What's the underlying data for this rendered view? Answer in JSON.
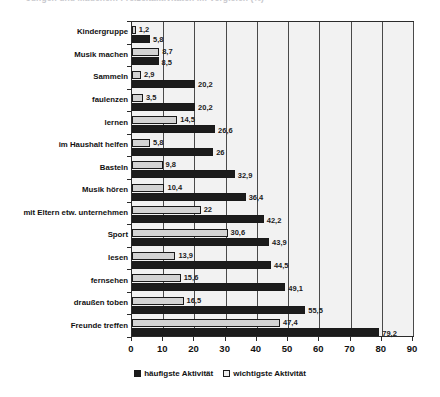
{
  "title_strip": {
    "text": "Jungen und Mädchen: Freizeitaktivitäten im Vergleich (%)"
  },
  "legend": {
    "position": "bottom-center",
    "entries": [
      {
        "label": "häufigste Aktivität",
        "swatch": "dark",
        "color": "#1c1c1c"
      },
      {
        "label": "wichtigste Aktivität",
        "swatch": "light",
        "color": "#ededed"
      }
    ]
  },
  "axis": {
    "x_ticks": [
      "0",
      "10",
      "20",
      "30",
      "40",
      "50",
      "60",
      "70",
      "80",
      "90"
    ]
  },
  "chart_data": {
    "type": "bar",
    "orientation": "horizontal",
    "title": "",
    "xlabel": "",
    "ylabel": "",
    "xlim": [
      0,
      90
    ],
    "xticks": [
      0,
      10,
      20,
      30,
      40,
      50,
      60,
      70,
      80,
      90
    ],
    "grid": true,
    "legend_position": "bottom-center",
    "categories": [
      "Kindergruppe",
      "Musik machen",
      "Sammeln",
      "faulenzen",
      "lernen",
      "im Haushalt helfen",
      "Basteln",
      "Musik hören",
      "mit Eltern etw. unternehmen",
      "Sport",
      "lesen",
      "fernsehen",
      "draußen toben",
      "Freunde treffen"
    ],
    "series": [
      {
        "name": "wichtigste Aktivität",
        "color": "#d3d3d3",
        "values": [
          1.2,
          8.7,
          2.9,
          3.5,
          14.5,
          5.8,
          9.8,
          10.4,
          22,
          30.6,
          13.9,
          15.6,
          16.5,
          47.4
        ],
        "labels": [
          "1,2",
          "8,7",
          "2,9",
          "3,5",
          "14,5",
          "5,8",
          "9,8",
          "10,4",
          "22",
          "30,6",
          "13,9",
          "15,6",
          "16,5",
          "47,4"
        ]
      },
      {
        "name": "häufigste Aktivität",
        "color": "#1c1c1c",
        "values": [
          5.8,
          8.5,
          20.2,
          20.2,
          26.6,
          26,
          32.9,
          36.4,
          42.2,
          43.9,
          44.5,
          49.1,
          55.5,
          79.2
        ],
        "labels": [
          "5,8",
          "8,5",
          "20,2",
          "20,2",
          "26,6",
          "26",
          "32,9",
          "36,4",
          "42,2",
          "43,9",
          "44,5",
          "49,1",
          "55,5",
          "79,2"
        ]
      }
    ]
  }
}
